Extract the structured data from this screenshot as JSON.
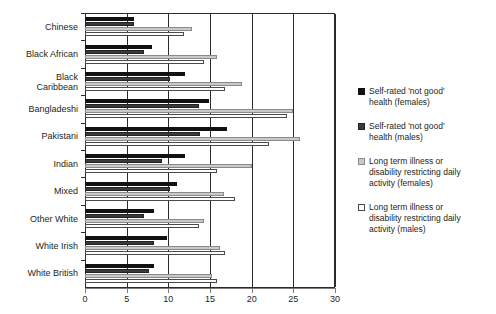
{
  "chart_data": {
    "type": "bar",
    "orientation": "horizontal",
    "title": "",
    "xlabel": "",
    "ylabel": "",
    "xlim": [
      0,
      30
    ],
    "xticks": [
      0,
      5,
      10,
      15,
      20,
      25,
      30
    ],
    "xtick_labels": [
      "0",
      "5",
      "10",
      "15",
      "20",
      "25",
      "30"
    ],
    "grid": true,
    "legend_position": "right",
    "categories": [
      "Chinese",
      "Black African",
      "Black Caribbean",
      "Bangladeshi",
      "Pakistani",
      "Indian",
      "Mixed",
      "Other White",
      "White Irish",
      "White British"
    ],
    "category_lines": [
      [
        "Chinese"
      ],
      [
        "Black African"
      ],
      [
        "Black",
        "Caribbean"
      ],
      [
        "Bangladeshi"
      ],
      [
        "Pakistani"
      ],
      [
        "Indian"
      ],
      [
        "Mixed"
      ],
      [
        "Other White"
      ],
      [
        "White Irish"
      ],
      [
        "White British"
      ]
    ],
    "series": [
      {
        "name": "Self-rated 'not good' health (females)",
        "color": "#111111",
        "values": [
          5.9,
          8.0,
          12.0,
          14.9,
          17.0,
          12.0,
          11.0,
          8.3,
          9.8,
          8.3
        ]
      },
      {
        "name": "Self-rated 'not good' health (males)",
        "color": "#3a3a3a",
        "values": [
          5.9,
          7.1,
          10.2,
          13.7,
          13.8,
          9.2,
          10.2,
          7.1,
          8.3,
          7.7
        ]
      },
      {
        "name": "Long term illness or disability restricting daily activity (females)",
        "color": "#c9c9c9",
        "values": [
          12.8,
          15.8,
          18.8,
          25.0,
          25.8,
          20.0,
          16.7,
          14.3,
          16.2,
          15.2
        ]
      },
      {
        "name": "Long term illness or disability restricting daily activity (males)",
        "color": "#ffffff",
        "values": [
          11.9,
          14.3,
          16.8,
          24.2,
          22.1,
          15.8,
          18.0,
          13.7,
          16.8,
          15.8
        ]
      }
    ]
  },
  "legend": {
    "items": [
      {
        "swatch": "s0",
        "lines": [
          "Self-rated 'not good'",
          "health (females)"
        ]
      },
      {
        "swatch": "s1",
        "lines": [
          "Self-rated 'not good'",
          "health (males)"
        ]
      },
      {
        "swatch": "s2",
        "lines": [
          "Long term illness or",
          "disability restricting daily",
          "activity (females)"
        ]
      },
      {
        "swatch": "s3",
        "lines": [
          "Long term illness or",
          "disability restricting daily",
          "activity (males)"
        ]
      }
    ]
  }
}
